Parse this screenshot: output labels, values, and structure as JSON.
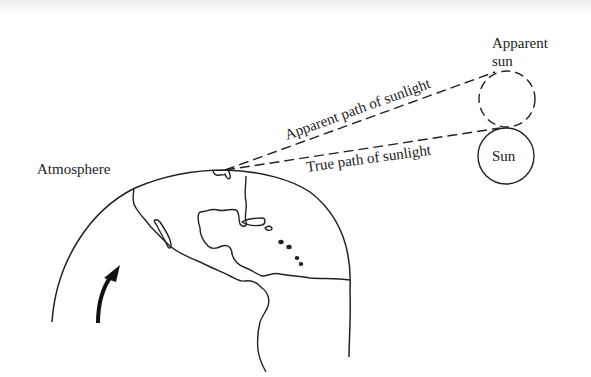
{
  "diagram": {
    "labels": {
      "atmosphere": "Atmosphere",
      "apparent_sun_line1": "Apparent",
      "apparent_sun_line2": "sun",
      "sun": "Sun",
      "apparent_path": "Apparent path of sunlight",
      "true_path": "True path of sunlight"
    },
    "colors": {
      "ink": "#222222",
      "background": "#ffffff"
    },
    "elements": {
      "earth": "globe showing North and Central America outline",
      "rotation_arrow": "curved arrow indicating Earth rotation",
      "apparent_sun": "dashed circle",
      "true_sun": "solid circle"
    }
  }
}
